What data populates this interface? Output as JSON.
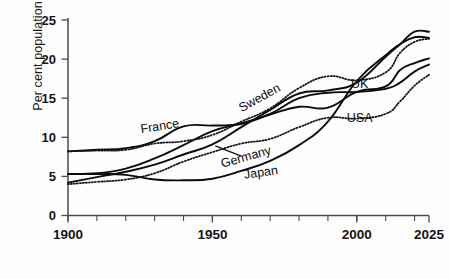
{
  "chart_data": {
    "type": "line",
    "title": "",
    "xlabel": "",
    "ylabel": "Per cent population over 65",
    "xlim": [
      1900,
      2025
    ],
    "ylim": [
      0,
      25
    ],
    "ytick_values": [
      0,
      5,
      10,
      15,
      20,
      25
    ],
    "ytick_labels": [
      "0",
      "5",
      "10",
      "15",
      "20",
      "25"
    ],
    "xtick_values": [
      1900,
      1950,
      2000,
      2025
    ],
    "xtick_labels": [
      "1900",
      "1950",
      "2000",
      "2025"
    ],
    "xtick_minor_step": 10,
    "grid": false,
    "legend": "inline-labels",
    "series": [
      {
        "name": "France",
        "style": "solid",
        "label_x": 1932,
        "label_y": 10.9,
        "label_rotation": -9,
        "x": [
          1900,
          1910,
          1920,
          1930,
          1940,
          1950,
          1960,
          1970,
          1980,
          1990,
          2000,
          2010,
          2015,
          2020,
          2025
        ],
        "values": [
          8.2,
          8.4,
          8.6,
          9.5,
          11.4,
          11.5,
          11.7,
          12.9,
          13.9,
          13.8,
          15.8,
          16.5,
          18.6,
          19.5,
          20.1
        ]
      },
      {
        "name": "Sweden",
        "style": "dotted",
        "label_x": 1967,
        "label_y": 14.6,
        "label_rotation": -29,
        "x": [
          1900,
          1910,
          1920,
          1930,
          1940,
          1950,
          1960,
          1970,
          1980,
          1990,
          2000,
          2010,
          2015,
          2020,
          2025
        ],
        "values": [
          8.2,
          8.3,
          8.4,
          9.2,
          9.5,
          10.3,
          12.0,
          13.7,
          16.3,
          17.8,
          17.3,
          18.3,
          20.8,
          22.2,
          22.6
        ]
      },
      {
        "name": "UK",
        "style": "solid",
        "label_x": 2001,
        "label_y": 16.3,
        "label_rotation": 0,
        "x": [
          1900,
          1910,
          1920,
          1930,
          1940,
          1950,
          1960,
          1970,
          1980,
          1990,
          2000,
          2010,
          2015,
          2020,
          2025
        ],
        "values": [
          5.3,
          5.4,
          6.0,
          7.3,
          9.0,
          10.8,
          11.8,
          13.0,
          15.0,
          15.7,
          15.8,
          16.2,
          17.0,
          18.4,
          19.3
        ]
      },
      {
        "name": "USA",
        "style": "dotted",
        "label_x": 2001,
        "label_y": 12.0,
        "label_rotation": 0,
        "x": [
          1900,
          1910,
          1920,
          1930,
          1940,
          1950,
          1960,
          1970,
          1980,
          1990,
          2000,
          2010,
          2015,
          2020,
          2025
        ],
        "values": [
          4.0,
          4.3,
          4.6,
          5.4,
          6.9,
          8.1,
          9.2,
          9.8,
          11.3,
          12.5,
          12.4,
          13.0,
          14.6,
          16.6,
          18.0
        ]
      },
      {
        "name": "Germany",
        "style": "solid",
        "label_x": 1962,
        "label_y": 7.0,
        "label_rotation": -16,
        "leader_from_x": 1951,
        "leader_from_y": 8.9,
        "leader_to_x": 1960,
        "leader_to_y": 7.6,
        "x": [
          1900,
          1910,
          1920,
          1930,
          1940,
          1950,
          1960,
          1970,
          1980,
          1990,
          2000,
          2010,
          2015,
          2020,
          2025
        ],
        "values": [
          4.2,
          4.9,
          5.6,
          6.5,
          7.8,
          9.1,
          11.3,
          13.5,
          15.6,
          16.0,
          17.0,
          20.3,
          21.9,
          23.5,
          23.5
        ]
      },
      {
        "name": "Japan",
        "style": "solid",
        "label_x": 1967,
        "label_y": 5.0,
        "label_rotation": -8,
        "x": [
          1900,
          1910,
          1920,
          1930,
          1940,
          1950,
          1960,
          1970,
          1980,
          1990,
          2000,
          2010,
          2015,
          2020,
          2025
        ],
        "values": [
          5.3,
          5.3,
          5.2,
          4.6,
          4.5,
          4.7,
          5.7,
          7.0,
          9.0,
          12.0,
          17.2,
          20.5,
          21.9,
          22.8,
          22.7
        ]
      }
    ]
  }
}
